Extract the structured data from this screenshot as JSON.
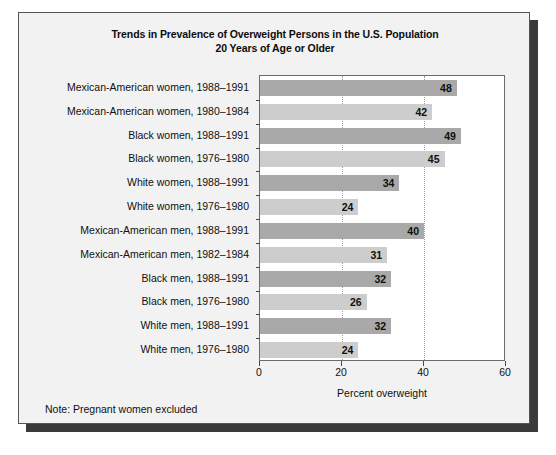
{
  "chart_data": {
    "type": "bar",
    "orientation": "horizontal",
    "title": "Trends in Prevalence of Overweight Persons in the U.S. Population 20 Years of Age or Older",
    "title_line1": "Trends in Prevalence of Overweight Persons in the U.S. Population",
    "title_line2": "20 Years of Age or Older",
    "xlabel": "Percent overweight",
    "ylabel": "",
    "xlim": [
      0,
      60
    ],
    "xticks": [
      0,
      20,
      40,
      60
    ],
    "xtick_labels": [
      "0",
      "20",
      "40",
      "60"
    ],
    "grid": "vertical-dotted-at-20-and-40",
    "legend": "none",
    "note": "Note: Pregnant women excluded",
    "colors": {
      "bar_recent": "#a9a9a9",
      "bar_earlier": "#cdcdcd",
      "plot_background": "#ffffff",
      "card_background": "#f2f2f2",
      "axis": "#6b6b6b",
      "gridline": "#9a9a9a",
      "text": "#101010"
    },
    "categories": [
      "Mexican-American women, 1988–1991",
      "Mexican-American women, 1980–1984",
      "Black women, 1988–1991",
      "Black women, 1976–1980",
      "White women, 1988–1991",
      "White women, 1976–1980",
      "Mexican-American men, 1988–1991",
      "Mexican-American men, 1982–1984",
      "Black men, 1988–1991",
      "Black men, 1976–1980",
      "White men, 1988–1991",
      "White men, 1976–1980"
    ],
    "values": [
      48,
      42,
      49,
      45,
      34,
      24,
      40,
      31,
      32,
      26,
      32,
      24
    ],
    "value_labels": [
      "48",
      "42",
      "49",
      "45",
      "34",
      "24",
      "40",
      "31",
      "32",
      "26",
      "32",
      "24"
    ],
    "bar_styles": [
      "dark",
      "light",
      "dark",
      "light",
      "dark",
      "light",
      "dark",
      "light",
      "dark",
      "light",
      "dark",
      "light"
    ],
    "bars": [
      {
        "label": "Mexican-American women, 1988–1991",
        "value": 48,
        "value_label": "48",
        "style": "dark"
      },
      {
        "label": "Mexican-American women, 1980–1984",
        "value": 42,
        "value_label": "42",
        "style": "light"
      },
      {
        "label": "Black women, 1988–1991",
        "value": 49,
        "value_label": "49",
        "style": "dark"
      },
      {
        "label": "Black women, 1976–1980",
        "value": 45,
        "value_label": "45",
        "style": "light"
      },
      {
        "label": "White women, 1988–1991",
        "value": 34,
        "value_label": "34",
        "style": "dark"
      },
      {
        "label": "White women, 1976–1980",
        "value": 24,
        "value_label": "24",
        "style": "light"
      },
      {
        "label": "Mexican-American men, 1988–1991",
        "value": 40,
        "value_label": "40",
        "style": "dark"
      },
      {
        "label": "Mexican-American men, 1982–1984",
        "value": 31,
        "value_label": "31",
        "style": "light"
      },
      {
        "label": "Black men, 1988–1991",
        "value": 32,
        "value_label": "32",
        "style": "dark"
      },
      {
        "label": "Black men, 1976–1980",
        "value": 26,
        "value_label": "26",
        "style": "light"
      },
      {
        "label": "White men, 1988–1991",
        "value": 32,
        "value_label": "32",
        "style": "dark"
      },
      {
        "label": "White men, 1976–1980",
        "value": 24,
        "value_label": "24",
        "style": "light"
      }
    ]
  }
}
